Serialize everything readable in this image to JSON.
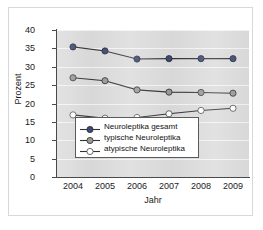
{
  "chart_data": {
    "type": "line",
    "title": "",
    "xlabel": "Jahr",
    "ylabel": "Prozent",
    "categories": [
      "2004",
      "2005",
      "2006",
      "2007",
      "2008",
      "2009"
    ],
    "x": [
      2004,
      2005,
      2006,
      2007,
      2008,
      2009
    ],
    "ylim": [
      0,
      40
    ],
    "yticks": [
      0,
      5,
      10,
      15,
      20,
      25,
      30,
      35,
      40
    ],
    "ytick_labels": [
      "0",
      "5",
      "10",
      "15",
      "20",
      "25",
      "30",
      "35",
      "40"
    ],
    "grid": true,
    "legend_position": "lower-center",
    "series": [
      {
        "name": "Neuroleptika gesamt",
        "values": [
          35.4,
          34.3,
          32.1,
          32.2,
          32.2,
          32.2
        ],
        "color": "#3b4a77",
        "marker": "filled-circle"
      },
      {
        "name": "typische Neuroleptika",
        "values": [
          27.0,
          26.2,
          23.7,
          23.1,
          23.0,
          22.8
        ],
        "color": "#9a9a9a",
        "marker": "filled-circle"
      },
      {
        "name": "atypische Neuroleptika",
        "values": [
          16.9,
          16.0,
          16.2,
          17.2,
          18.1,
          18.7
        ],
        "color": "#ffffff",
        "marker": "open-circle"
      }
    ]
  },
  "style": {
    "plot_background": "#dcdcdc",
    "gridline_color": "#f4f4f4",
    "axis_color": "#4a4a4a",
    "line_color": "#333333",
    "card_background": "#ffffff",
    "card_border": "#d8d8d8"
  }
}
